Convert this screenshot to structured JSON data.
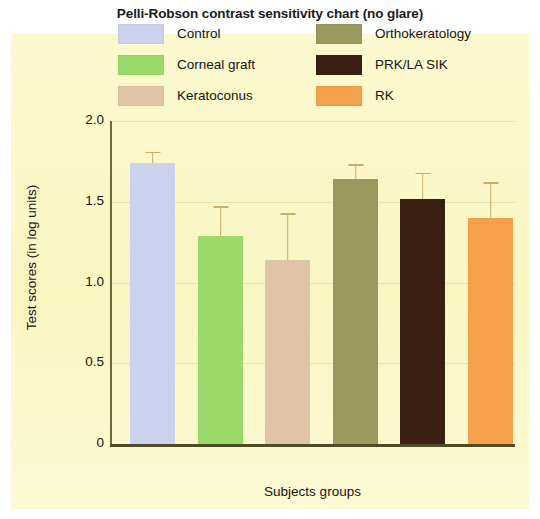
{
  "title": "Pelli-Robson contrast sensitivity chart (no glare)",
  "axis": {
    "y_label": "Test scores (in log units)",
    "x_label": "Subjects groups",
    "y_ticks": [
      "2.0",
      "1.5",
      "1.0",
      "0.5",
      "0"
    ]
  },
  "legend": {
    "left_column": [
      {
        "label": "Control",
        "color": "#ccd2ee"
      },
      {
        "label": "Corneal graft",
        "color": "#9bd96a"
      },
      {
        "label": "Keratoconus",
        "color": "#e0c4a6"
      }
    ],
    "right_column": [
      {
        "label": "Orthokeratology",
        "color": "#9a9a5e"
      },
      {
        "label": "PRK/LA SIK",
        "color": "#3a2014"
      },
      {
        "label": "RK",
        "color": "#f5a04a"
      }
    ]
  },
  "colors": {
    "panel_background": "#fbf8c8",
    "axis": "#4e4b26",
    "error_bar": "#c9ae69",
    "title_text": "#1b1b1b"
  },
  "chart_data": {
    "type": "bar",
    "title": "Pelli-Robson contrast sensitivity chart (no glare)",
    "xlabel": "Subjects groups",
    "ylabel": "Test scores (in log units)",
    "ylim": [
      0,
      2.0
    ],
    "yticks": [
      0,
      0.5,
      1.0,
      1.5,
      2.0
    ],
    "grid": true,
    "legend_position": "top-center",
    "categories": [
      "Control",
      "Corneal graft",
      "Keratoconus",
      "Orthokeratology",
      "PRK/LA SIK",
      "RK"
    ],
    "values": [
      1.74,
      1.29,
      1.14,
      1.64,
      1.52,
      1.4
    ],
    "errors_upper": [
      0.06,
      0.17,
      0.28,
      0.08,
      0.15,
      0.21
    ],
    "colors": [
      "#ccd2ee",
      "#9bd96a",
      "#e0c4a6",
      "#9a9a5e",
      "#3a2014",
      "#f5a04a"
    ],
    "series": [
      {
        "name": "Test scores (in log units)",
        "values": [
          1.74,
          1.29,
          1.14,
          1.64,
          1.52,
          1.4
        ]
      }
    ]
  }
}
